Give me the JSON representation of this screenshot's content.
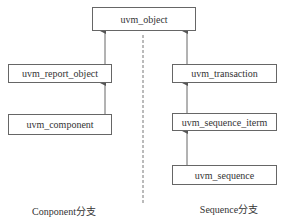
{
  "diagram": {
    "type": "class-inheritance",
    "root": {
      "id": "uvm_object",
      "label": "uvm_object"
    },
    "branches": [
      {
        "name": "component",
        "caption": "Conponent分支",
        "nodes": [
          {
            "id": "uvm_report_object",
            "label": "uvm_report_object",
            "parent": "uvm_object"
          },
          {
            "id": "uvm_component",
            "label": "uvm_component",
            "parent": "uvm_report_object"
          }
        ]
      },
      {
        "name": "sequence",
        "caption": "Sequence分支",
        "nodes": [
          {
            "id": "uvm_transaction",
            "label": "uvm_transaction",
            "parent": "uvm_object"
          },
          {
            "id": "uvm_sequence_iterm",
            "label": "uvm_sequence_iterm",
            "parent": "uvm_transaction"
          },
          {
            "id": "uvm_sequence",
            "label": "uvm_sequence",
            "parent": "uvm_sequence_iterm"
          }
        ]
      }
    ],
    "separator": "dashed-vertical",
    "colors": {
      "stroke": "#666666",
      "text": "#333333",
      "background": "#ffffff"
    }
  }
}
